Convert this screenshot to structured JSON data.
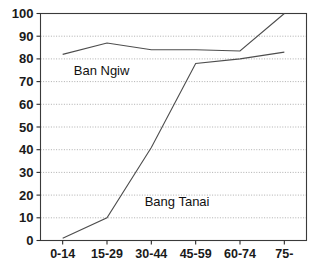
{
  "chart_data": {
    "type": "line",
    "title": "",
    "xlabel": "",
    "ylabel": "",
    "categories": [
      "0-14",
      "15-29",
      "30-44",
      "45-59",
      "60-74",
      "75-"
    ],
    "ylim": [
      0,
      100
    ],
    "yticks": [
      0,
      10,
      20,
      30,
      40,
      50,
      60,
      70,
      80,
      90,
      100
    ],
    "grid": true,
    "legend_position": "inline-annotations",
    "series": [
      {
        "name": "Ban Ngiw",
        "values": [
          82,
          87,
          84,
          84,
          83.5,
          100
        ],
        "color": "#4d4d4d"
      },
      {
        "name": "Bang Tanai",
        "values": [
          1,
          10,
          41,
          78,
          80,
          83
        ],
        "color": "#4d4d4d"
      }
    ],
    "annotations": [
      {
        "text": "Ban Ngiw",
        "x_value": 0.25,
        "y_value": 73
      },
      {
        "text": "Bang Tanai",
        "x_value": 1.85,
        "y_value": 15
      }
    ]
  }
}
